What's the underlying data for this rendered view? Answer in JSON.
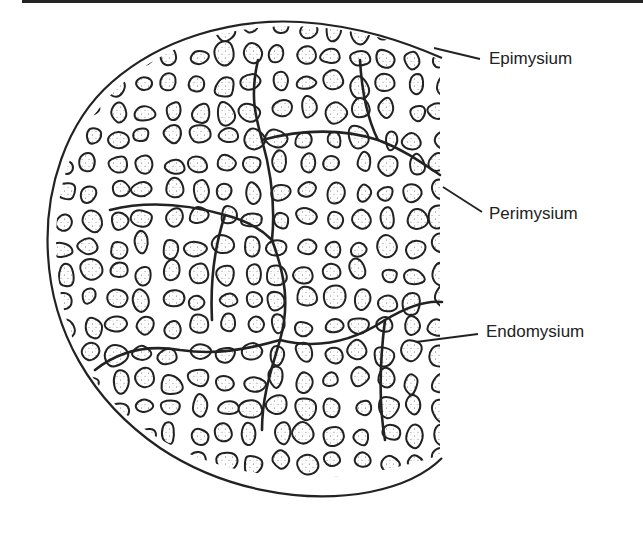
{
  "figure": {
    "type": "anatomical cross-section diagram",
    "colors": {
      "line": "#222222",
      "stipple": "#6a6a6a",
      "background": "#ffffff"
    }
  },
  "labels": [
    {
      "id": "epimysium",
      "text": "Epimysium"
    },
    {
      "id": "perimysium",
      "text": "Perimysium"
    },
    {
      "id": "endomysium",
      "text": "Endomysium"
    }
  ]
}
